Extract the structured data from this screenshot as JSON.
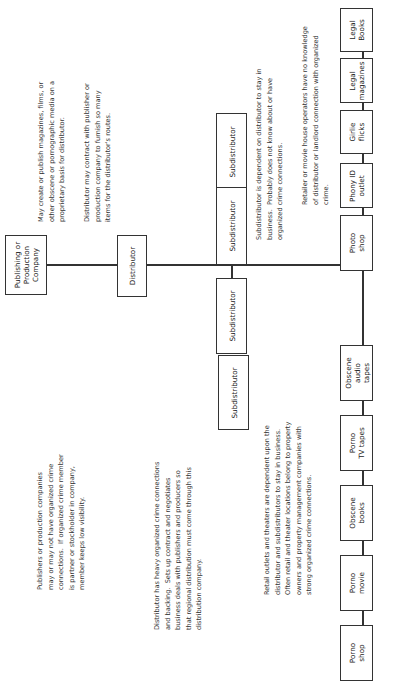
{
  "diagram": {
    "orientation": "rotated -90deg (reads bottom-to-top)",
    "nodes": {
      "publisher": "Publishing or\nProduction\nCompany",
      "distributor": "Distributor",
      "subdistributors": [
        "Subdistributor",
        "Subdistributor",
        "Subdistributor",
        "Subdistributor"
      ],
      "retail": [
        "Porno\nshop",
        "Porno\nmovie",
        "Obscene\nbooks",
        "Porno\nTV tapes",
        "Obscene\naudio\ntapes",
        "Photo\nshop",
        "Phony ID\noutlet",
        "Girlie\nflicks",
        "Legal\nmagazines",
        "Legal\nBooks"
      ]
    },
    "notes": {
      "publisher_left": "Publishers or production companies\nmay or may not have organized crime\nconnections.  If organized crime member\nis partner or stockholder in company,\nmember keeps low visibility.",
      "publisher_right": "May create or publish magazines, films, or\nother obscene or pornographic media on a\nproprietary basis for distributor.",
      "distributor_right": "Distributor may contract with publisher or\nproduction company to furnish so many\nitems for the distributor's routes.",
      "distributor_left": "Distributor has heavy organized crime connections\nand backing.  Sets up contract and negotiates\nbusiness deals with publishers and producers so\nthat regional distribution must come through this\ndistribution company.",
      "subdistributor_right": "Subdistributor is dependent on distributor to stay in\nbusiness.  Probably does not know about or have\norganized crime connections.",
      "retail_left": "Retail outlets and theaters are dependent upon the\ndistributor and subdistributors to stay in business.\nOften retail and theater locations belong to property\nowners and property management companies with\nstrong organized crime connections.",
      "retail_right": "Retailer or movie house operators have no knowledge\nof distributor or landlord connection with organized\ncrime."
    }
  }
}
